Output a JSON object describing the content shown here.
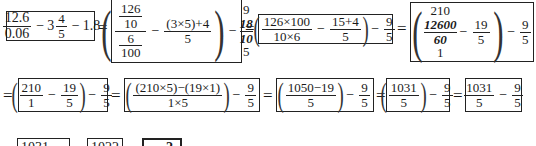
{
  "row1": {
    "box1": {
      "num": "12.6",
      "den": "0.06",
      "minus1": "−",
      "whole": "3",
      "mnum": "4",
      "mden": "5",
      "minus2": "−",
      "tail": "1.8"
    },
    "eq1": "=",
    "box2": {
      "top": "126",
      "topden": "10",
      "botnum": "6",
      "botden": "100",
      "minus": "−",
      "num": "(3×5)+4",
      "den": "5",
      "minus2": "−",
      "s1": "9",
      "s2": "18",
      "s3": "10",
      "s4": "5"
    },
    "eq2": "=",
    "box3": {
      "num1": "126×100",
      "den1": "10×6",
      "minus": "−",
      "num2": "15+4",
      "den2": "5",
      "minus2": "−",
      "num3": "9",
      "den3": "5"
    },
    "eq3": "=",
    "box4": {
      "s1": "210",
      "s2": "12600",
      "s3": "60",
      "s4": "1",
      "minus": "−",
      "num2": "19",
      "den2": "5",
      "minus2": "−",
      "num3": "9",
      "den3": "5"
    }
  },
  "row2": {
    "eq0": "=",
    "box1": {
      "num1": "210",
      "den1": "1",
      "minus": "−",
      "num2": "19",
      "den2": "5",
      "minus2": "−",
      "num3": "9",
      "den3": "5"
    },
    "eq1": "=",
    "box2": {
      "num1": "(210×5)−(19×1)",
      "den1": "1×5",
      "minus2": "−",
      "num3": "9",
      "den3": "5"
    },
    "eq2": "=",
    "box3": {
      "num1": "1050−19",
      "den1": "5",
      "minus2": "−",
      "num3": "9",
      "den3": "5"
    },
    "eq3": "=",
    "box4": {
      "num1": "1031",
      "den1": "5",
      "minus2": "−",
      "num3": "9",
      "den3": "5"
    },
    "eq4": "=",
    "box5": {
      "num1": "1031",
      "den1": "5",
      "minus": "−",
      "num2": "9",
      "den2": "5"
    }
  },
  "row3": {
    "box1": {
      "num": "1031 − 9"
    },
    "box2": {
      "num": "1022"
    },
    "box3": {
      "num": "2"
    }
  }
}
